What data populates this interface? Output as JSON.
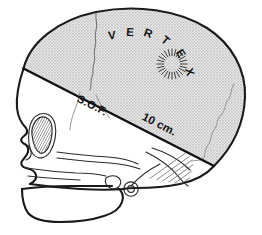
{
  "figure": {
    "background_color": "#ffffff",
    "width": 262,
    "height": 235
  },
  "shading": {
    "name": "halftone-gray-fill",
    "fill_color": "#d4d4d4",
    "dot_color": "#b4b4b4",
    "description": "stippled screen-tone gray filling the calvarium above the cut line"
  },
  "annotations": {
    "vertex_label": {
      "text": "VERTEX",
      "letters": [
        "V",
        "E",
        "R",
        "T",
        "E",
        "X"
      ],
      "color": "#141414"
    },
    "sof_label": {
      "text": "S.O.F.",
      "color": "#121212"
    },
    "scale_label": {
      "text": "10 cm.",
      "color": "#121212"
    }
  },
  "markers": {
    "starburst": {
      "name": "radial-burst-marker",
      "ray_count": 24,
      "color": "#3c3c3c"
    }
  },
  "anatomy": {
    "parts": [
      {
        "name": "calvarium",
        "label": "Calvarium"
      },
      {
        "name": "frontal-bone",
        "label": "Frontal bone"
      },
      {
        "name": "parietal-bone",
        "label": "Parietal bone"
      },
      {
        "name": "occipital-bone",
        "label": "Occipital bone"
      },
      {
        "name": "coronal-suture",
        "label": "Coronal suture"
      },
      {
        "name": "lambdoid-suture",
        "label": "Lambdoid suture"
      },
      {
        "name": "orbit",
        "label": "Orbit"
      },
      {
        "name": "nasal-aperture",
        "label": "Nasal aperture"
      },
      {
        "name": "maxilla",
        "label": "Maxilla"
      },
      {
        "name": "mandible",
        "label": "Mandible"
      },
      {
        "name": "zygomatic-arch",
        "label": "Zygomatic arch"
      },
      {
        "name": "mastoid-process",
        "label": "Mastoid process"
      },
      {
        "name": "external-auditory-meatus",
        "label": "External auditory meatus"
      }
    ]
  },
  "lines": {
    "cut_line": {
      "name": "skull-section-cut-line",
      "color": "#111111",
      "description": "oblique line from frontal bone to occiput separating shaded calvarium"
    }
  }
}
